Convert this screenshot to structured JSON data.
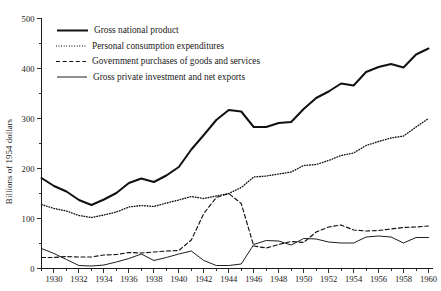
{
  "chart_data": {
    "type": "line",
    "title": "",
    "xlabel": "",
    "ylabel": "Billions of 1954 dollars",
    "xlim": [
      1929,
      1960
    ],
    "ylim": [
      0,
      500
    ],
    "grid": false,
    "legend_position": "top-left",
    "y_ticks": [
      0,
      100,
      200,
      300,
      400,
      500
    ],
    "y_tick_labels": [
      "0",
      "100",
      "200",
      "300",
      "400",
      "500"
    ],
    "y_minor_ticks": [
      50,
      150,
      250,
      350,
      450
    ],
    "x_ticks": [
      1930,
      1932,
      1934,
      1936,
      1938,
      1940,
      1942,
      1944,
      1946,
      1948,
      1950,
      1952,
      1954,
      1956,
      1958,
      1960
    ],
    "x_tick_labels": [
      "1930",
      "1932",
      "1934",
      "1936",
      "1938",
      "1940",
      "1942",
      "1944",
      "1946",
      "1948",
      "1950",
      "1952",
      "1954",
      "1956",
      "1958",
      "1960"
    ],
    "x_minor_ticks": [
      1929,
      1931,
      1933,
      1935,
      1937,
      1939,
      1941,
      1943,
      1945,
      1947,
      1949,
      1951,
      1953,
      1955,
      1957,
      1959
    ],
    "x": [
      1929,
      1930,
      1931,
      1932,
      1933,
      1934,
      1935,
      1936,
      1937,
      1938,
      1939,
      1940,
      1941,
      1942,
      1943,
      1944,
      1945,
      1946,
      1947,
      1948,
      1949,
      1950,
      1951,
      1952,
      1953,
      1954,
      1955,
      1956,
      1957,
      1958,
      1959,
      1960
    ],
    "series": [
      {
        "name": "Gross national product",
        "style": "thick-solid",
        "values": [
          181,
          165,
          154,
          137,
          127,
          138,
          151,
          171,
          180,
          173,
          186,
          203,
          238,
          267,
          297,
          317,
          314,
          283,
          283,
          291,
          293,
          319,
          341,
          354,
          370,
          366,
          393,
          403,
          409,
          402,
          428,
          440
        ]
      },
      {
        "name": "Personal consumption expenditures",
        "style": "dotted",
        "values": [
          128,
          120,
          115,
          106,
          102,
          107,
          113,
          123,
          126,
          124,
          131,
          137,
          144,
          140,
          145,
          150,
          162,
          183,
          185,
          189,
          193,
          206,
          208,
          216,
          226,
          231,
          246,
          254,
          261,
          265,
          283,
          300
        ]
      },
      {
        "name": "Government purchases of goods and services",
        "style": "dashed",
        "values": [
          22,
          22,
          24,
          23,
          23,
          27,
          28,
          32,
          31,
          33,
          35,
          36,
          57,
          110,
          142,
          150,
          130,
          45,
          41,
          48,
          54,
          52,
          73,
          83,
          87,
          77,
          75,
          76,
          79,
          82,
          83,
          85
        ]
      },
      {
        "name": "Gross private investment and net exports",
        "style": "thin-solid",
        "values": [
          40,
          30,
          18,
          6,
          5,
          7,
          13,
          20,
          29,
          16,
          22,
          29,
          35,
          16,
          6,
          6,
          9,
          48,
          56,
          55,
          47,
          60,
          59,
          53,
          51,
          51,
          63,
          65,
          63,
          51,
          62,
          62
        ]
      }
    ],
    "legend": [
      {
        "label": "Gross national product",
        "style": "thick-solid"
      },
      {
        "label": "Personal consumption expenditures",
        "style": "dotted"
      },
      {
        "label": "Government purchases of goods and services",
        "style": "dashed"
      },
      {
        "label": "Gross private investment and net exports",
        "style": "thin-solid"
      }
    ]
  }
}
